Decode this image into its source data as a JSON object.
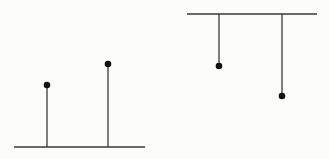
{
  "colors": {
    "background": "#fcfcfb",
    "line": "#3a3a3a",
    "dot": "#111111"
  },
  "diagrams": [
    {
      "name": "upward-stems",
      "baseline": {
        "x1": 14,
        "x2": 145,
        "y": 147
      },
      "stems": [
        {
          "x": 47,
          "y_end": 85
        },
        {
          "x": 108,
          "y_end": 64
        }
      ]
    },
    {
      "name": "hanging-stems",
      "baseline": {
        "x1": 187,
        "x2": 317,
        "y": 14
      },
      "stems": [
        {
          "x": 219,
          "y_end": 66
        },
        {
          "x": 282,
          "y_end": 96
        }
      ]
    }
  ]
}
